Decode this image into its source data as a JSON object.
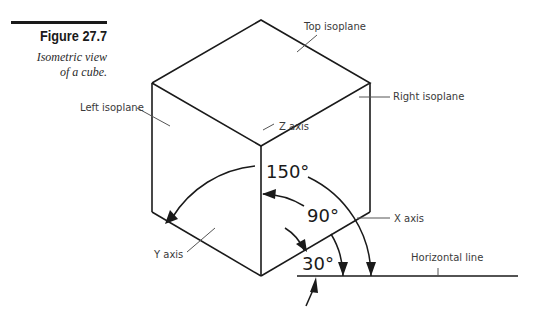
{
  "figure": {
    "number": "Figure 27.7",
    "caption_line1": "Isometric view",
    "caption_line2": "of a cube."
  },
  "labels": {
    "top_isoplane": "Top isoplane",
    "left_isoplane": "Left isoplane",
    "right_isoplane": "Right isoplane",
    "z_axis": "Z axis",
    "x_axis": "X axis",
    "y_axis": "Y axis",
    "horizontal_line": "Horizontal line"
  },
  "angles": {
    "a150": "150°",
    "a90": "90°",
    "a30": "30°"
  }
}
